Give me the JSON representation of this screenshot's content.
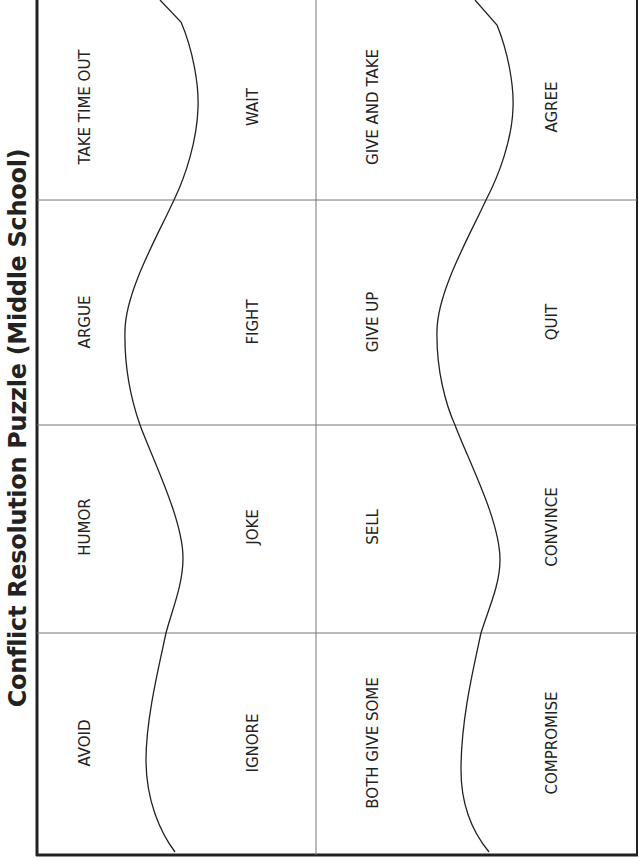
{
  "title": "Conflict Resolution Puzzle (Middle School)",
  "rows": [
    {
      "cells": [
        "TAKE TIME OUT",
        "WAIT",
        "GIVE AND TAKE",
        "AGREE"
      ]
    },
    {
      "cells": [
        "ARGUE",
        "FIGHT",
        "GIVE UP",
        "QUIT"
      ]
    },
    {
      "cells": [
        "HUMOR",
        "JOKE",
        "SELL",
        "CONVINCE"
      ]
    },
    {
      "cells": [
        "AVOID",
        "IGNORE",
        "BOTH GIVE SOME",
        "COMPROMISE"
      ]
    }
  ],
  "colors": {
    "ink": "#222222",
    "grid": "#777777",
    "border": "#222222"
  }
}
